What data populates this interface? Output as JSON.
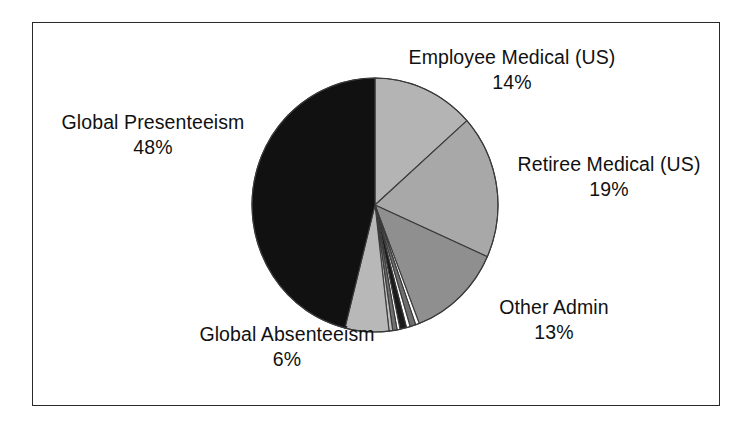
{
  "figure": {
    "width": 754,
    "height": 431,
    "background": "#ffffff",
    "border_color": "#2a2a2a"
  },
  "chart_data": {
    "type": "pie",
    "title": "",
    "subtitle": "",
    "xlabel": "",
    "ylabel": "",
    "legend_position": "none",
    "grid": false,
    "labels_shown_on_chart": true,
    "start_angle_deg": 0,
    "direction": "clockwise",
    "categories": [
      "Employee Medical (US)",
      "Retiree Medical (US)",
      "Other Admin",
      "Global Absenteeism",
      "Global Presenteeism"
    ],
    "values": [
      14,
      19,
      13,
      6,
      48
    ],
    "value_labels": [
      "14%",
      "19%",
      "13%",
      "6%",
      "48%"
    ],
    "slices": [
      {
        "name": "Employee Medical (US)",
        "value": 14,
        "value_label": "14%",
        "color": "#b4b4b4",
        "labeled": true
      },
      {
        "name": "Retiree Medical (US)",
        "value": 19,
        "value_label": "19%",
        "color": "#a8a8a8",
        "labeled": true
      },
      {
        "name": "Other Admin",
        "value": 13,
        "value_label": "13%",
        "color": "#8f8f8f",
        "labeled": true
      },
      {
        "name": "",
        "value": 0.5,
        "value_label": "",
        "color": "#ffffff",
        "labeled": false
      },
      {
        "name": "",
        "value": 0.8,
        "value_label": "",
        "color": "#6e6e6e",
        "labeled": false
      },
      {
        "name": "",
        "value": 0.5,
        "value_label": "",
        "color": "#ffffff",
        "labeled": false
      },
      {
        "name": "",
        "value": 0.9,
        "value_label": "",
        "color": "#1a1a1a",
        "labeled": false
      },
      {
        "name": "",
        "value": 0.4,
        "value_label": "",
        "color": "#ffffff",
        "labeled": false
      },
      {
        "name": "",
        "value": 0.6,
        "value_label": "",
        "color": "#707070",
        "labeled": false
      },
      {
        "name": "",
        "value": 0.5,
        "value_label": "",
        "color": "#c0c0c0",
        "labeled": false
      },
      {
        "name": "Global Absenteeism",
        "value": 6,
        "value_label": "6%",
        "color": "#b8b8b8",
        "labeled": true
      },
      {
        "name": "Global Presenteeism",
        "value": 48,
        "value_label": "48%",
        "color": "#111111",
        "labeled": true
      }
    ]
  },
  "labels": {
    "employee_medical": {
      "name": "Employee Medical (US)",
      "pct": "14%"
    },
    "retiree_medical": {
      "name": "Retiree Medical (US)",
      "pct": "19%"
    },
    "global_presenteeism": {
      "name": "Global Presenteeism",
      "pct": "48%"
    },
    "global_absenteeism": {
      "name": "Global Absenteeism",
      "pct": "6%"
    },
    "other_admin": {
      "name": "Other Admin",
      "pct": "13%"
    }
  },
  "geometry": {
    "center_x": 375,
    "center_y": 205,
    "radius_x": 123,
    "radius_y": 127,
    "stroke_color": "#3a3a3a",
    "stroke_width": 1.1
  }
}
